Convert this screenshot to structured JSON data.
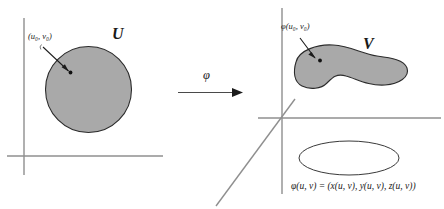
{
  "figure": {
    "caption_type": "math-diagram",
    "domain_label": "U",
    "image_label": "V",
    "map_symbol": "φ",
    "point_label_left": "(u₀, v₀)",
    "point_label_right": "φ(u₀, v₀)",
    "equation": "φ(u, v) = (x(u, v), y(u, v), z(u, v))"
  },
  "left_panel": {
    "name": "uv-parameter-plane",
    "axes": {
      "vertical_label": "v-axis",
      "horizontal_label": "u-axis"
    },
    "region": {
      "shape": "circle",
      "fill": "#a9a9a9",
      "stroke": "#2b2b2b",
      "label": "U"
    },
    "marked_point": {
      "label": "(u₀, v₀)",
      "dot_color": "#111111"
    }
  },
  "arrow_panel": {
    "name": "mapping-arrow",
    "symbol": "φ",
    "direction": "left-to-right"
  },
  "right_panel": {
    "name": "xyz-space",
    "axes": {
      "vertical_label": "z-axis",
      "horizontal_label": "y-axis",
      "diagonal_label": "x-axis"
    },
    "region": {
      "shape": "blob",
      "fill": "#a9a9a9",
      "stroke": "#2b2b2b",
      "label": "V"
    },
    "projection": {
      "shape": "ellipse",
      "fill": "none",
      "stroke": "#3a3a3a"
    },
    "marked_point": {
      "label": "φ(u₀, v₀)",
      "dot_color": "#111111"
    },
    "equation": "φ(u, v) = (x(u, v), y(u, v), z(u, v))"
  },
  "colors": {
    "region_fill": "#a9a9a9",
    "region_stroke": "#2b2b2b",
    "axis": "#8a8a8a",
    "text": "#1a1a1a"
  }
}
